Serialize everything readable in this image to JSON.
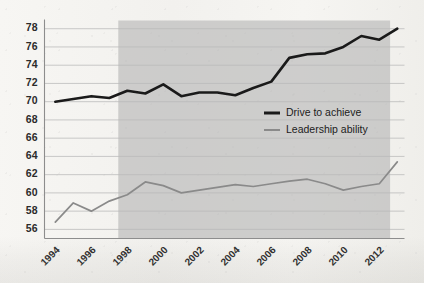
{
  "chart_data": {
    "type": "line",
    "title": "",
    "subtitle": "",
    "xlabel": "",
    "ylabel": "",
    "xlim": [
      1993.4,
      2013.4
    ],
    "ylim": [
      55.0,
      78.9
    ],
    "ytick_step": 2,
    "yticks": [
      56,
      58,
      60,
      62,
      64,
      66,
      68,
      70,
      72,
      74,
      76,
      78
    ],
    "ytick_labels": [
      "56",
      "58",
      "60",
      "62",
      "64",
      "66",
      "68",
      "70",
      "72",
      "74",
      "76",
      "78"
    ],
    "xticks": [
      1994,
      1996,
      1998,
      2000,
      2002,
      2004,
      2006,
      2008,
      2010,
      2012
    ],
    "xtick_labels": [
      "1994",
      "1996",
      "1998",
      "2000",
      "2002",
      "2004",
      "2006",
      "2008",
      "2010",
      "2012"
    ],
    "xtick_rotation_deg": 45,
    "grid": true,
    "grid_axis": "y",
    "grid_color": "#b9b9b9",
    "axis_color": "#8d8d8d",
    "background_color": "#f4f3f0",
    "legend_position": "center-right",
    "shaded_band": {
      "label": "",
      "x_start": 1997.5,
      "x_end": 2012.6,
      "color": "#b5b5b5",
      "opacity": 0.62
    },
    "x": [
      1994,
      1995,
      1996,
      1997,
      1998,
      1999,
      2000,
      2001,
      2002,
      2003,
      2004,
      2005,
      2006,
      2007,
      2008,
      2009,
      2010,
      2011,
      2012,
      2013
    ],
    "series": [
      {
        "name": "Drive to achieve",
        "color": "#1a1a1a",
        "width": 2.6,
        "values": [
          70.0,
          70.3,
          70.6,
          70.4,
          71.2,
          70.9,
          71.9,
          70.6,
          71.0,
          71.0,
          70.7,
          71.5,
          72.2,
          74.8,
          75.2,
          75.3,
          76.0,
          77.2,
          76.8,
          78.0
        ]
      },
      {
        "name": "Leadership ability",
        "color": "#8a8a8a",
        "width": 1.7,
        "values": [
          56.8,
          58.9,
          58.0,
          59.1,
          59.8,
          61.2,
          60.8,
          60.0,
          60.3,
          60.6,
          60.9,
          60.7,
          61.0,
          61.3,
          61.5,
          61.0,
          60.3,
          60.7,
          61.0,
          63.4
        ]
      }
    ],
    "legend": [
      {
        "label": "Drive to achieve",
        "color": "#1a1a1a",
        "width": 3.0
      },
      {
        "label": "Leadership ability",
        "color": "#8a8a8a",
        "width": 2.0
      }
    ]
  }
}
